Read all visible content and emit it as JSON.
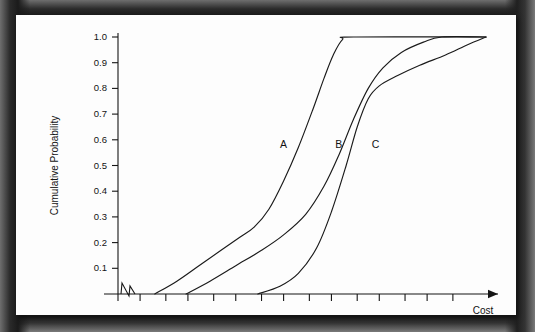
{
  "figure": {
    "background_color": "#fdfdfd",
    "border_color": "#1b1b1b",
    "line_color": "#1a1a1a"
  },
  "chart_data": {
    "type": "line",
    "title": "",
    "subtitle": "",
    "xlabel": "Cost",
    "ylabel": "Cumulative Probability",
    "ylim": [
      0.0,
      1.0
    ],
    "xlim": [
      0,
      100
    ],
    "grid": false,
    "legend": "inline-curve-labels",
    "y_ticks": [
      0.1,
      0.2,
      0.3,
      0.4,
      0.5,
      0.6,
      0.7,
      0.8,
      0.9,
      1.0
    ],
    "y_tick_labels": [
      "0.1",
      "0.2",
      "0.3",
      "0.4",
      "0.5",
      "0.6",
      "0.7",
      "0.8",
      "0.9",
      "1.0"
    ],
    "x_ticks": [
      0,
      6,
      13,
      19,
      26,
      32,
      39,
      45,
      52,
      58,
      65,
      71,
      78,
      84,
      91
    ],
    "x_tick_labels": [
      "",
      "",
      "",
      "",
      "",
      "",
      "",
      "",
      "",
      "",
      "",
      "",
      "",
      "",
      ""
    ],
    "x_axis_break": true,
    "x_axis_arrow": true,
    "annotations": [
      {
        "text": "A",
        "x": 45,
        "y": 0.57
      },
      {
        "text": "B",
        "x": 60,
        "y": 0.57
      },
      {
        "text": "C",
        "x": 70,
        "y": 0.57
      }
    ],
    "series": [
      {
        "name": "A",
        "label": "A",
        "points": [
          {
            "x": 10.0,
            "y": 0.0
          },
          {
            "x": 16.0,
            "y": 0.05
          },
          {
            "x": 22.0,
            "y": 0.11
          },
          {
            "x": 28.0,
            "y": 0.17
          },
          {
            "x": 33.0,
            "y": 0.22
          },
          {
            "x": 37.0,
            "y": 0.26
          },
          {
            "x": 41.0,
            "y": 0.33
          },
          {
            "x": 45.0,
            "y": 0.44
          },
          {
            "x": 49.0,
            "y": 0.57
          },
          {
            "x": 53.0,
            "y": 0.72
          },
          {
            "x": 56.0,
            "y": 0.84
          },
          {
            "x": 58.5,
            "y": 0.93
          },
          {
            "x": 61.0,
            "y": 0.99
          },
          {
            "x": 64.0,
            "y": 1.0
          },
          {
            "x": 100.0,
            "y": 1.0
          }
        ]
      },
      {
        "name": "B",
        "label": "B",
        "points": [
          {
            "x": 18.5,
            "y": 0.0
          },
          {
            "x": 25.0,
            "y": 0.05
          },
          {
            "x": 32.0,
            "y": 0.11
          },
          {
            "x": 39.0,
            "y": 0.17
          },
          {
            "x": 45.0,
            "y": 0.23
          },
          {
            "x": 51.0,
            "y": 0.31
          },
          {
            "x": 56.0,
            "y": 0.42
          },
          {
            "x": 60.0,
            "y": 0.54
          },
          {
            "x": 64.0,
            "y": 0.68
          },
          {
            "x": 68.0,
            "y": 0.8
          },
          {
            "x": 72.0,
            "y": 0.88
          },
          {
            "x": 77.0,
            "y": 0.94
          },
          {
            "x": 83.0,
            "y": 0.98
          },
          {
            "x": 88.0,
            "y": 1.0
          },
          {
            "x": 100.0,
            "y": 1.0
          }
        ]
      },
      {
        "name": "C",
        "label": "C",
        "points": [
          {
            "x": 38.0,
            "y": 0.0
          },
          {
            "x": 44.0,
            "y": 0.03
          },
          {
            "x": 49.0,
            "y": 0.08
          },
          {
            "x": 54.0,
            "y": 0.18
          },
          {
            "x": 58.0,
            "y": 0.32
          },
          {
            "x": 62.0,
            "y": 0.5
          },
          {
            "x": 65.0,
            "y": 0.65
          },
          {
            "x": 68.0,
            "y": 0.76
          },
          {
            "x": 71.0,
            "y": 0.81
          },
          {
            "x": 76.0,
            "y": 0.85
          },
          {
            "x": 82.0,
            "y": 0.89
          },
          {
            "x": 89.0,
            "y": 0.93
          },
          {
            "x": 95.0,
            "y": 0.97
          },
          {
            "x": 100.0,
            "y": 1.0
          }
        ]
      }
    ]
  }
}
